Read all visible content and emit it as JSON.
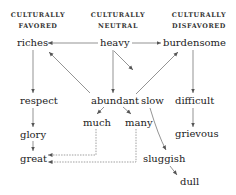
{
  "headers": {
    "favored": [
      "CULTURALLY",
      "FAVORED"
    ],
    "neutral": [
      "CULTURALLY",
      "NEUTRAL"
    ],
    "disfavored": [
      "CULTURALLY",
      "DISFAVORED"
    ]
  },
  "words": {
    "riches": "riches",
    "heavy": "heavy",
    "burdensome": "burdensome",
    "respect": "respect",
    "abundant": "abundant",
    "slow": "slow",
    "difficult": "difficult",
    "much": "much",
    "many": "many",
    "glory": "glory",
    "grievous": "grievous",
    "great": "great",
    "sluggish": "sluggish",
    "dull": "dull"
  },
  "colors": {
    "text": "#222222",
    "line": "#555555"
  }
}
